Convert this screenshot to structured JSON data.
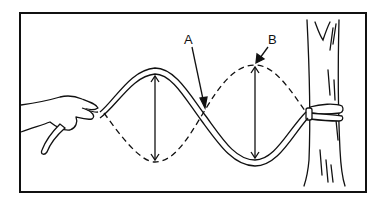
{
  "figure": {
    "labels": {
      "a": "A",
      "b": "B"
    },
    "colors": {
      "ink": "#111111",
      "background": "#ffffff"
    }
  }
}
